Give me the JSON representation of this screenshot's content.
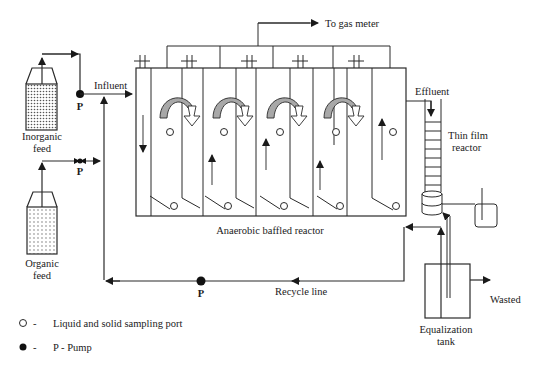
{
  "diagram": {
    "labels": {
      "gas_meter": "To gas meter",
      "influent": "Influent",
      "effluent": "Effluent",
      "thin_film_line1": "Thin film",
      "thin_film_line2": "reactor",
      "abr": "Anaerobic baffled reactor",
      "recycle": "Recycle line",
      "wasted": "Wasted",
      "eq_tank_line1": "Equalization",
      "eq_tank_line2": "tank",
      "inorganic_line1": "Inorganic",
      "inorganic_line2": "feed",
      "organic_line1": "Organic",
      "organic_line2": "feed",
      "pump_1": "P",
      "pump_2": "P",
      "pump_3": "P"
    },
    "legend": [
      {
        "symbol": "open-circle",
        "dash": "-",
        "text": "Liquid and solid sampling port"
      },
      {
        "symbol": "filled-circle",
        "dash": "-",
        "text": "P - Pump"
      }
    ],
    "compartments": 5,
    "colors": {
      "line": "#2a2a2a",
      "flow_arrow_fill": "#a8a8a8",
      "background": "#ffffff"
    }
  }
}
